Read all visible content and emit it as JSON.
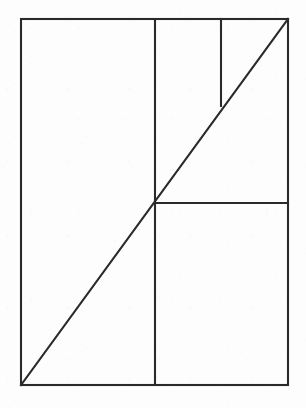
{
  "page": {
    "width": 306,
    "height": 408,
    "background_color": "#fdfdfd",
    "media": "scanned-paper-diagram"
  },
  "figure": {
    "name": "rectangle-with-diagonal-and-subdivisions",
    "stroke_color": "#2a2a2a",
    "stroke_width": 2.1,
    "fill": "none",
    "bounds": {
      "x1": 21,
      "y1": 19,
      "x2": 288,
      "y2": 385
    },
    "labels": [],
    "annotations": [],
    "shapes": [
      {
        "id": "outer-rectangle",
        "type": "rect",
        "x": 21,
        "y": 19,
        "width": 267,
        "height": 366
      },
      {
        "id": "vertical-divider-main",
        "type": "line",
        "x1": 155,
        "y1": 19,
        "x2": 155,
        "y2": 385
      },
      {
        "id": "vertical-divider-short",
        "type": "line",
        "x1": 221,
        "y1": 19,
        "x2": 221,
        "y2": 106
      },
      {
        "id": "horizontal-divider-right",
        "type": "line",
        "x1": 155,
        "y1": 203,
        "x2": 288,
        "y2": 203
      },
      {
        "id": "diagonal-corner-to-corner",
        "type": "line",
        "x1": 21,
        "y1": 385,
        "x2": 288,
        "y2": 19
      }
    ]
  }
}
